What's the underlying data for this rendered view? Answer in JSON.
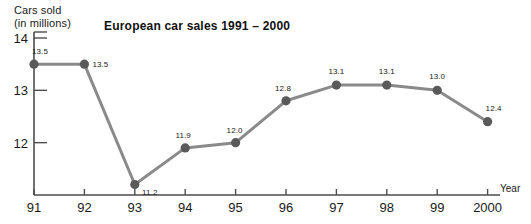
{
  "chart_data": {
    "type": "line",
    "title": "European car sales 1991 – 2000",
    "xlabel": "Year",
    "ylabel": "Cars sold\n(in millions)",
    "categories": [
      "91",
      "92",
      "93",
      "94",
      "95",
      "96",
      "97",
      "98",
      "99",
      "2000"
    ],
    "values": [
      13.5,
      13.5,
      11.2,
      11.9,
      12.0,
      12.8,
      13.1,
      13.1,
      13.0,
      12.4
    ],
    "point_labels": [
      "13.5",
      "13.5",
      "11.2",
      "11.9",
      "12.0",
      "12.8",
      "13.1",
      "13.1",
      "13.0",
      "12.4"
    ],
    "ylim": [
      11.0,
      14.0
    ],
    "yticks": [
      12,
      13,
      14
    ],
    "ytick_labels": [
      "12",
      "13",
      "14"
    ],
    "grid": false,
    "legend": false,
    "colors": {
      "line": "#8a8a8a",
      "marker": "#5a5a5a",
      "axis": "#4d4d4d",
      "text": "#1a1a1a",
      "background": "#ffffff"
    }
  },
  "axes": {
    "y_axis_title": "Cars sold\n(in millions)",
    "x_axis_title": "Year"
  }
}
